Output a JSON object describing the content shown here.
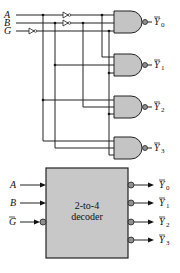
{
  "figure": {
    "logic_circuit": {
      "inputs": [
        {
          "label": "A"
        },
        {
          "label": "B"
        },
        {
          "label": "G"
        }
      ],
      "outputs": [
        {
          "label": "Y",
          "subscript": "0"
        },
        {
          "label": "Y",
          "subscript": "1"
        },
        {
          "label": "Y",
          "subscript": "2"
        },
        {
          "label": "Y",
          "subscript": "3"
        }
      ],
      "gate_type": "NAND"
    },
    "block_symbol": {
      "title_line1": "2-to-4",
      "title_line2": "decoder",
      "inputs": [
        {
          "label": "A"
        },
        {
          "label": "B"
        },
        {
          "label": "G"
        }
      ],
      "outputs": [
        {
          "label": "Y",
          "subscript": "0"
        },
        {
          "label": "Y",
          "subscript": "1"
        },
        {
          "label": "Y",
          "subscript": "2"
        },
        {
          "label": "Y",
          "subscript": "3"
        }
      ]
    }
  },
  "colors": {
    "gate_fill": "#c4c4c4",
    "block_fill": "#c8c8c8",
    "line": "#222222"
  }
}
